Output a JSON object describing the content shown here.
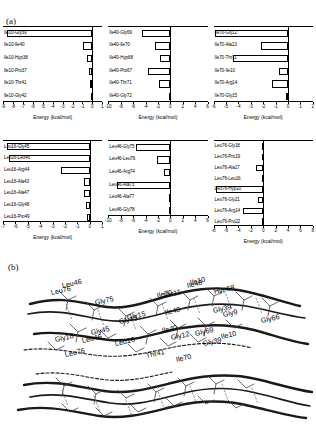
{
  "figure": {
    "panel_a_tag": "(a)",
    "panel_b_tag": "(b)",
    "axis_title": "Energy (kcal/mol)"
  },
  "chart_data": [
    {
      "id": "ile10",
      "type": "bar",
      "orientation": "horizontal",
      "title": "",
      "xlabel": "Energy (kcal/mol)",
      "ylabel": "",
      "xlim": [
        -9,
        1
      ],
      "ticks": [
        -9,
        -8,
        -7,
        -6,
        -5,
        -4,
        -3,
        -2,
        -1,
        0,
        1
      ],
      "grid": false,
      "categories": [
        "Ile10-Gly39",
        "Ile10-Ile40",
        "Ile10-Hyp38",
        "Ile10-Pro37",
        "Ile10-Thr41",
        "Ile10-Gly42"
      ],
      "values": [
        -8.6,
        -0.9,
        -0.5,
        -0.35,
        -0.2,
        -0.15
      ]
    },
    {
      "id": "ile40",
      "type": "bar",
      "orientation": "horizontal",
      "title": "",
      "xlabel": "Energy (kcal/mol)",
      "ylabel": "",
      "xlim": [
        -10,
        6
      ],
      "ticks": [
        -10,
        -8,
        -6,
        -4,
        -2,
        0,
        2,
        4,
        6
      ],
      "grid": false,
      "categories": [
        "Ile40-Gly69",
        "Ile40-Ile70",
        "Ile40-Hyp68",
        "Ile40-Pro67",
        "Ile40-Thr71",
        "Ile40-Gly72"
      ],
      "values": [
        -4.6,
        -2.4,
        -1.6,
        -3.6,
        -1.8,
        -0.15
      ]
    },
    {
      "id": "ile70",
      "type": "bar",
      "orientation": "horizontal",
      "title": "",
      "xlabel": "Energy (kcal/mol)",
      "ylabel": "",
      "xlim": [
        -6,
        2
      ],
      "ticks": [
        -6,
        -5,
        -4,
        -3,
        -2,
        -1,
        0,
        1,
        2
      ],
      "grid": false,
      "categories": [
        "Ile70-Gly12",
        "Ile70-Ala13",
        "Ile70-Thr11",
        "Ile70-Ile10",
        "Ile70-Arg14",
        "Ile70-Gly15"
      ],
      "values": [
        -5.9,
        -2.2,
        -4.4,
        -0.7,
        -1.3,
        -0.15
      ]
    },
    {
      "id": "leu16",
      "type": "bar",
      "orientation": "horizontal",
      "title": "",
      "xlabel": "Energy (kcal/mol)",
      "ylabel": "",
      "xlim": [
        -7,
        1
      ],
      "ticks": [
        -7,
        -6,
        -5,
        -4,
        -3,
        -2,
        -1,
        0,
        1
      ],
      "grid": false,
      "categories": [
        "Leu16-Gly45",
        "Leu16-Leu46",
        "Leu16-Arg44",
        "Leu16-Ala43",
        "Leu16-Ala47",
        "Leu16-Gly48",
        "Leu16-Pro49"
      ],
      "values": [
        -6.7,
        -6.5,
        -2.3,
        -0.45,
        -0.45,
        -0.3,
        -0.2
      ]
    },
    {
      "id": "leu46",
      "type": "bar",
      "orientation": "horizontal",
      "title": "",
      "xlabel": "Energy (kcal/mol)",
      "ylabel": "",
      "xlim": [
        -10,
        6
      ],
      "ticks": [
        -10,
        -8,
        -6,
        -4,
        -2,
        0,
        2,
        4,
        6
      ],
      "grid": false,
      "categories": [
        "Leu46-Gly75",
        "Leu46-Leu76",
        "Leu46-Arg74",
        "Leu46-Ala73",
        "Leu46-Ala77",
        "Leu46-Gly78"
      ],
      "values": [
        -5.6,
        -2.1,
        -1.1,
        -8.6,
        -0.25,
        -0.2
      ]
    },
    {
      "id": "leu76",
      "type": "bar",
      "orientation": "horizontal",
      "title": "",
      "xlabel": "Energy (kcal/mol)",
      "ylabel": "",
      "xlim": [
        -8,
        8
      ],
      "ticks": [
        -8,
        -6,
        -4,
        -2,
        0,
        2,
        4,
        6,
        8
      ],
      "grid": false,
      "categories": [
        "Leu76-Gly18",
        "Leu76-Pro19",
        "Leu76-Ala17",
        "Leu76-Leu16",
        "Leu76-Hyp20",
        "Leu76-Gly21",
        "Leu76-Arg14",
        "Leu76-Pro22"
      ],
      "values": [
        -0.2,
        -0.2,
        -1.2,
        -0.25,
        -7.6,
        -0.9,
        -3.3,
        -0.2
      ]
    }
  ],
  "structure": {
    "labels_top": [
      {
        "text": "Leu46",
        "x": 63,
        "y": 23,
        "rot": -13
      },
      {
        "text": "Thr11",
        "x": 164,
        "y": 33,
        "rot": -13
      },
      {
        "text": "Ile10",
        "x": 191,
        "y": 20,
        "rot": -13
      },
      {
        "text": "Hyp68",
        "x": 215,
        "y": 29,
        "rot": -13
      },
      {
        "text": "Gly15",
        "x": 128,
        "y": 55,
        "rot": -13
      },
      {
        "text": "Ile40",
        "x": 166,
        "y": 50,
        "rot": -13
      },
      {
        "text": "Gly9",
        "x": 224,
        "y": 52,
        "rot": -13
      },
      {
        "text": "Gly66",
        "x": 262,
        "y": 58,
        "rot": -13
      },
      {
        "text": "Gly45",
        "x": 92,
        "y": 70,
        "rot": -13
      },
      {
        "text": "Ile40",
        "x": 163,
        "y": 68,
        "rot": -13
      },
      {
        "text": "Gly39",
        "x": 204,
        "y": 81,
        "rot": -13
      },
      {
        "text": "Thr41",
        "x": 147,
        "y": 93,
        "rot": -13
      },
      {
        "text": "Ile70",
        "x": 177,
        "y": 97,
        "rot": -13
      },
      {
        "text": "Leu76",
        "x": 66,
        "y": 92,
        "rot": -13
      }
    ],
    "labels_bottom": [
      {
        "text": "Leu76",
        "x": 52,
        "y": 30,
        "rot": -13
      },
      {
        "text": "Gly75",
        "x": 96,
        "y": 40,
        "rot": -13
      },
      {
        "text": "Ile70",
        "x": 158,
        "y": 33,
        "rot": -13
      },
      {
        "text": "Ile40",
        "x": 188,
        "y": 23,
        "rot": -13
      },
      {
        "text": "Gly39",
        "x": 214,
        "y": 48,
        "rot": -13
      },
      {
        "text": "Gly45",
        "x": 120,
        "y": 59,
        "rot": -13
      },
      {
        "text": "Gly18",
        "x": 56,
        "y": 77,
        "rot": -13
      },
      {
        "text": "Leu46",
        "x": 83,
        "y": 78,
        "rot": -13
      },
      {
        "text": "Leu16",
        "x": 116,
        "y": 81,
        "rot": -13
      },
      {
        "text": "Gly12",
        "x": 172,
        "y": 75,
        "rot": -13
      },
      {
        "text": "Gly69",
        "x": 196,
        "y": 71,
        "rot": -13
      },
      {
        "text": "Ile10",
        "x": 222,
        "y": 74,
        "rot": -13
      }
    ]
  }
}
